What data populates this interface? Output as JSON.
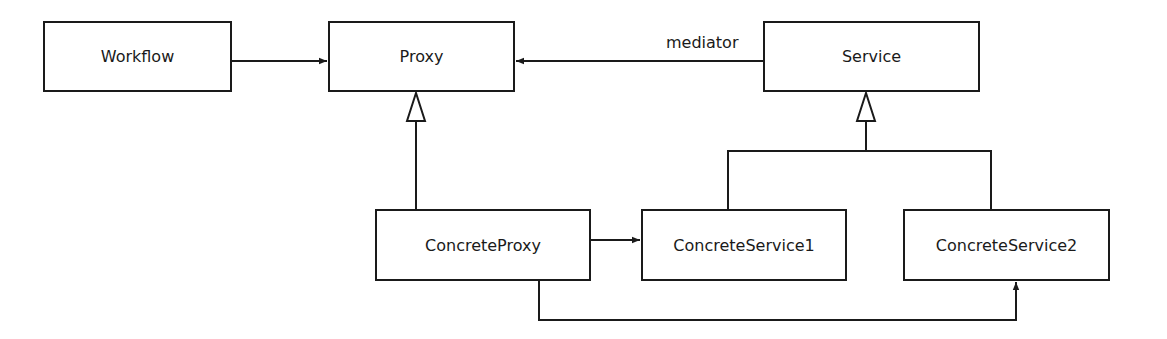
{
  "diagram": {
    "type": "uml-class-diagram",
    "nodes": [
      {
        "id": "workflow",
        "label": "Workflow",
        "x": 43,
        "y": 21,
        "w": 189,
        "h": 71
      },
      {
        "id": "proxy",
        "label": "Proxy",
        "x": 328,
        "y": 21,
        "w": 187,
        "h": 71
      },
      {
        "id": "service",
        "label": "Service",
        "x": 763,
        "y": 21,
        "w": 217,
        "h": 71
      },
      {
        "id": "concrete_proxy",
        "label": "ConcreteProxy",
        "x": 375,
        "y": 209,
        "w": 216,
        "h": 72
      },
      {
        "id": "concrete_service1",
        "label": "ConcreteService1",
        "x": 641,
        "y": 209,
        "w": 206,
        "h": 72
      },
      {
        "id": "concrete_service2",
        "label": "ConcreteService2",
        "x": 903,
        "y": 209,
        "w": 207,
        "h": 72
      }
    ],
    "edges": [
      {
        "from": "workflow",
        "to": "proxy",
        "kind": "association",
        "label": ""
      },
      {
        "from": "service",
        "to": "proxy",
        "kind": "association",
        "label": "mediator"
      },
      {
        "from": "concrete_proxy",
        "to": "proxy",
        "kind": "generalization",
        "label": ""
      },
      {
        "from": "concrete_service1",
        "to": "service",
        "kind": "generalization",
        "label": ""
      },
      {
        "from": "concrete_service2",
        "to": "service",
        "kind": "generalization",
        "label": ""
      },
      {
        "from": "concrete_proxy",
        "to": "concrete_service1",
        "kind": "association",
        "label": ""
      },
      {
        "from": "concrete_proxy",
        "to": "concrete_service2",
        "kind": "association",
        "label": ""
      }
    ],
    "edge_labels": {
      "mediator": "mediator"
    },
    "colors": {
      "stroke": "#1a1a1a",
      "background": "#ffffff"
    }
  }
}
